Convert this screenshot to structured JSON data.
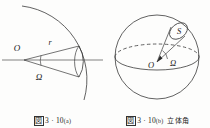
{
  "figure": {
    "background_color": "#fdfdfc",
    "ink_color": "#1a1a1a",
    "panels": [
      {
        "id": "a",
        "caption_symbol": "図",
        "caption_number": "3",
        "caption_separator": "·",
        "caption_index": "10",
        "caption_suffix": "(a)",
        "caption_extra": "",
        "labels": {
          "origin": "O",
          "radius": "r",
          "solid_angle": "Ω"
        }
      },
      {
        "id": "b",
        "caption_symbol": "図",
        "caption_number": "3",
        "caption_separator": "·",
        "caption_index": "10",
        "caption_suffix": "(b)",
        "caption_extra": "立体角",
        "labels": {
          "origin": "O",
          "solid_angle": "Ω",
          "area": "S"
        }
      }
    ]
  }
}
